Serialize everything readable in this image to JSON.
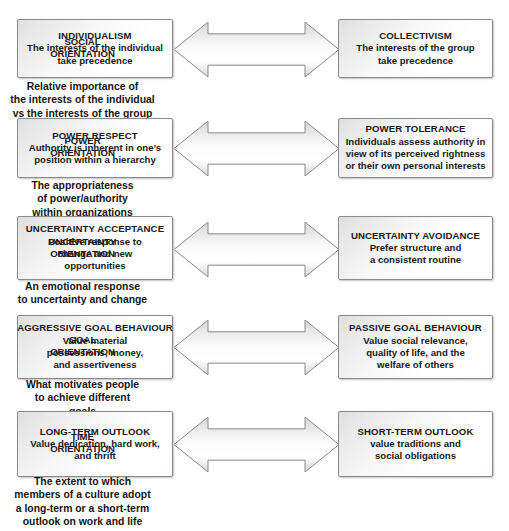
{
  "diagram": {
    "type": "bipolar-continuum-diagram",
    "arrow_style": "double-headed horizontal arrow",
    "colors": {
      "box_border": "#8a8a8a",
      "box_fill_light": "#ffffff",
      "box_fill_dark": "#dedede",
      "arrow_border": "#8a8a8a",
      "text": "#1a1a1a",
      "background": "#ffffff"
    },
    "rows": [
      {
        "id": "social-orientation",
        "center_label_line1": "SOCIAL",
        "center_label_line2": "ORIENTATION",
        "caption": [
          "Relative importance of",
          "the interests of the individual",
          "vs the interests of the group"
        ],
        "left": {
          "title": "INDIVIDUALISM",
          "lines": [
            "The interests of the individual",
            "take precedence"
          ]
        },
        "right": {
          "title": "COLLECTIVISM",
          "lines": [
            "The interests of the group",
            "take precedence"
          ]
        }
      },
      {
        "id": "power-orientation",
        "center_label_line1": "POWER",
        "center_label_line2": "ORIENTATION",
        "caption": [
          "The appropriateness",
          "of power/authority",
          "within organizations"
        ],
        "left": {
          "title": "POWER RESPECT",
          "lines": [
            "Authority is inherent in one’s",
            "position within a hierarchy"
          ]
        },
        "right": {
          "title": "POWER TOLERANCE",
          "lines": [
            "Individuals assess authority in",
            "view of its perceived rightness",
            "or their own personal interests"
          ]
        }
      },
      {
        "id": "uncertainty-orientation",
        "center_label_line1": "UNCERTAINTY",
        "center_label_line2": "ORIENTATION",
        "caption": [
          "An emotional response",
          "to uncertainty and change"
        ],
        "left": {
          "title": "UNCERTAINTY ACCEPTANCE",
          "lines": [
            "Positive response to",
            "change and new",
            "opportunities"
          ]
        },
        "right": {
          "title": "UNCERTAINTY AVOIDANCE",
          "lines": [
            "Prefer structure and",
            "a consistent routine"
          ]
        }
      },
      {
        "id": "goal-orientation",
        "center_label_line1": "GOAL",
        "center_label_line2": "ORIENTATION",
        "caption": [
          "What motivates people",
          "to achieve different",
          "goals"
        ],
        "left": {
          "title": "AGGRESSIVE GOAL BEHAVIOUR",
          "lines": [
            "Value material",
            "possessions, money,",
            "and assertiveness"
          ]
        },
        "right": {
          "title": "PASSIVE GOAL BEHAVIOUR",
          "lines": [
            "Value social relevance,",
            "quality of life, and the",
            "welfare of others"
          ]
        }
      },
      {
        "id": "time-orientation",
        "center_label_line1": "TIME",
        "center_label_line2": "ORIENTATION",
        "caption": [
          "The extent to which",
          "members of a culture adopt",
          "a long-term or a short-term",
          "outlook on work and life"
        ],
        "left": {
          "title": "LONG-TERM OUTLOOK",
          "lines": [
            "Value dedication, hard work,",
            "and thrift"
          ]
        },
        "right": {
          "title": "SHORT-TERM OUTLOOK",
          "lines": [
            "value traditions and",
            "social obligations"
          ]
        }
      }
    ]
  }
}
